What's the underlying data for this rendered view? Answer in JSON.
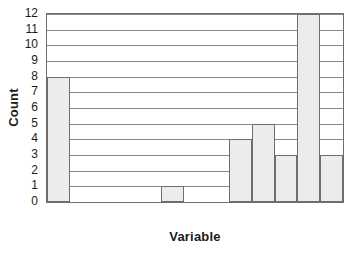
{
  "chart_data": {
    "type": "bar",
    "title": "",
    "subtitle": "",
    "xlabel": "Variable",
    "ylabel": "Count",
    "ylim": [
      0,
      12
    ],
    "xlim": [
      0,
      13
    ],
    "grid": true,
    "legend": null,
    "yticks": [
      0,
      1,
      2,
      3,
      4,
      5,
      6,
      7,
      8,
      9,
      10,
      11,
      12
    ],
    "ytick_labels": [
      "0",
      "1",
      "2",
      "3",
      "4",
      "5",
      "6",
      "7",
      "8",
      "9",
      "10",
      "11",
      "12"
    ],
    "xtick_labels": [],
    "categories": [
      "1",
      "2",
      "3",
      "4",
      "5",
      "6",
      "7",
      "8",
      "9",
      "10",
      "11",
      "12",
      "13"
    ],
    "values": [
      8,
      0,
      0,
      0,
      1,
      0,
      0,
      4,
      5,
      3,
      0,
      12,
      3
    ],
    "bars": [
      {
        "label": "bar-1",
        "value": 8,
        "bin_start": 0,
        "bin_end": 1
      },
      {
        "label": "bar-2",
        "value": 1,
        "bin_start": 5,
        "bin_end": 6
      },
      {
        "label": "bar-3",
        "value": 4,
        "bin_start": 8,
        "bin_end": 9
      },
      {
        "label": "bar-4",
        "value": 5,
        "bin_start": 9,
        "bin_end": 10
      },
      {
        "label": "bar-5",
        "value": 3,
        "bin_start": 10,
        "bin_end": 11
      },
      {
        "label": "bar-6",
        "value": 12,
        "bin_start": 11,
        "bin_end": 12
      },
      {
        "label": "bar-7",
        "value": 3,
        "bin_start": 12,
        "bin_end": 13
      }
    ],
    "colors": {
      "bar_fill": "#ececec",
      "bar_stroke": "#6e6e6e",
      "gridline": "#8a8a8a",
      "frame": "#6e6e6e",
      "text": "#1b1b1b",
      "background": "#ffffff"
    }
  }
}
